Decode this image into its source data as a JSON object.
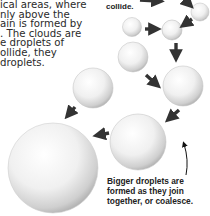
{
  "intro_text": {
    "lines": [
      "ical areas, where",
      "nly above the",
      "ain is formed by",
      ". The clouds are",
      "e droplets of",
      "ollide, they",
      "droplets."
    ]
  },
  "labels": {
    "collide": "collide.",
    "caption_lines": [
      "Bigger droplets are",
      "formed as they join",
      "together, or coalesce."
    ]
  },
  "diagram": {
    "droplets": [
      {
        "id": "tiny-top-right",
        "cx": 200,
        "cy": 12,
        "r": 9
      },
      {
        "id": "small-top",
        "cx": 132,
        "cy": 27,
        "r": 9
      },
      {
        "id": "small-middle",
        "cx": 172,
        "cy": 30,
        "r": 10
      },
      {
        "id": "medium-left",
        "cx": 93,
        "cy": 88,
        "r": 20
      },
      {
        "id": "medium-center",
        "cx": 133,
        "cy": 57,
        "r": 15
      },
      {
        "id": "medium-right",
        "cx": 183,
        "cy": 86,
        "r": 20
      },
      {
        "id": "large",
        "cx": 138,
        "cy": 142,
        "r": 28
      },
      {
        "id": "largest",
        "cx": 53,
        "cy": 168,
        "r": 45
      }
    ],
    "colors": {
      "arrow": "#333333",
      "droplet_highlight": "#ffffff",
      "droplet_shadow": "#b8b8b8"
    }
  }
}
